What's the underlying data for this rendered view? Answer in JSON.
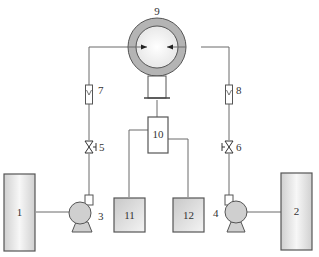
{
  "diagram": {
    "type": "process-flow-schematic",
    "components": [
      {
        "id": "1",
        "label": "1",
        "kind": "tank-left"
      },
      {
        "id": "2",
        "label": "2",
        "kind": "tank-right"
      },
      {
        "id": "3",
        "label": "3",
        "kind": "pump-left"
      },
      {
        "id": "4",
        "label": "4",
        "kind": "pump-right"
      },
      {
        "id": "5",
        "label": "5",
        "kind": "valve-left"
      },
      {
        "id": "6",
        "label": "6",
        "kind": "valve-right"
      },
      {
        "id": "7",
        "label": "7",
        "kind": "flowmeter-left"
      },
      {
        "id": "8",
        "label": "8",
        "kind": "flowmeter-right"
      },
      {
        "id": "9",
        "label": "9",
        "kind": "membrane-cell"
      },
      {
        "id": "10",
        "label": "10",
        "kind": "collector"
      },
      {
        "id": "11",
        "label": "11",
        "kind": "container-left"
      },
      {
        "id": "12",
        "label": "12",
        "kind": "container-right"
      }
    ],
    "colors": {
      "line": "#6a6a6a",
      "outer_ring": "#b0b0b0",
      "inner_circle": "#f2f2f2",
      "fill_light": "#e4e4e4",
      "stroke": "#555555"
    }
  }
}
